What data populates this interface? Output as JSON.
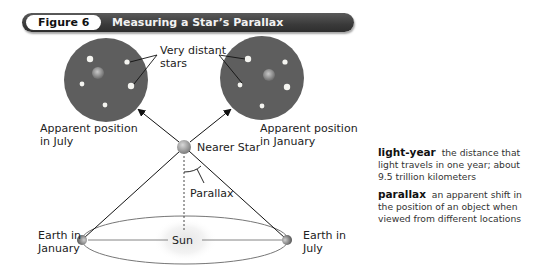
{
  "figure": {
    "number_label": "Figure 6",
    "title": "Measuring a Star’s Parallax"
  },
  "diagram": {
    "labels": {
      "very_distant_line1": "Very distant",
      "very_distant_line2": "stars",
      "apparent_july_line1": "Apparent position",
      "apparent_july_line2": "in July",
      "apparent_january_line1": "Apparent position",
      "apparent_january_line2": "in January",
      "nearer_star": "Nearer Star",
      "parallax": "Parallax",
      "sun": "Sun",
      "earth_january_line1": "Earth in",
      "earth_january_line2": "January",
      "earth_july_line1": "Earth in",
      "earth_july_line2": "July"
    },
    "colors": {
      "sky_disc": "#5e5e5e",
      "distant_star": "#f4f4f0",
      "nearer_star": "#9a9a9a",
      "orbit": "#777777",
      "header_bg": "#3a3a3a"
    }
  },
  "glossary": [
    {
      "term": "light-year",
      "definition": "the distance that light travels in one year; about 9.5 trillion kilometers"
    },
    {
      "term": "parallax",
      "definition": "an apparent shift in the position of an object when viewed from different locations"
    }
  ]
}
